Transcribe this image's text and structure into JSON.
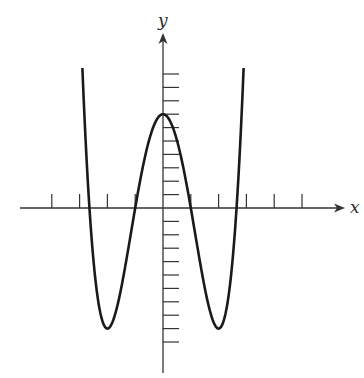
{
  "chart_data": {
    "type": "line",
    "title": "",
    "xlabel": "x",
    "ylabel": "y",
    "function": "y = x^4 - 8x^2 + 7",
    "coefficients": {
      "x4": 1,
      "x2": -8,
      "x0": 7
    },
    "x_domain": [
      -2.9,
      2.9
    ],
    "xlim": [
      -5.2,
      6.5
    ],
    "ylim": [
      -12.3,
      13.8
    ],
    "x_ticks": [
      -4,
      -3,
      -2,
      -1,
      1,
      2,
      3,
      4,
      5
    ],
    "y_ticks": [
      -10,
      -9,
      -8,
      -7,
      -6,
      -5,
      -4,
      -3,
      -2,
      -1,
      1,
      2,
      3,
      4,
      5,
      6,
      7,
      8,
      9,
      10
    ],
    "tick_labels_shown": false,
    "grid": false,
    "legend": null,
    "key_points": {
      "local_max": [
        0,
        7
      ],
      "local_min": [
        [
          -2,
          -9
        ],
        [
          2,
          -9
        ]
      ],
      "x_intercepts": [
        -2.6458,
        -1,
        1,
        2.6458
      ],
      "y_intercept": 7
    },
    "series": [
      {
        "name": "f(x)",
        "color": "#1a1a1a"
      }
    ]
  },
  "axes": {
    "x_label": "x",
    "y_label": "y",
    "color": "#333333"
  }
}
